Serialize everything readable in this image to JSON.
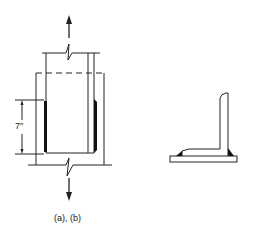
{
  "figure": {
    "dimension_label": "7″",
    "caption": "(a), (b)"
  },
  "colors": {
    "line": "#222222",
    "weld": "#111111",
    "background": "#ffffff"
  }
}
